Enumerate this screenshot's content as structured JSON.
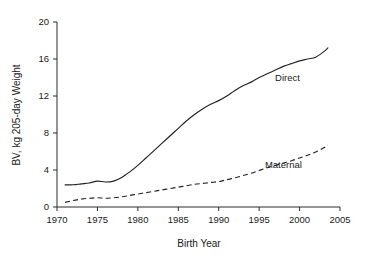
{
  "chart_data": {
    "type": "line",
    "title": "",
    "xlabel": "Birth Year",
    "ylabel": "BV, kg 205-day Weight",
    "xlim": [
      1970,
      2005
    ],
    "ylim": [
      0,
      20
    ],
    "grid": false,
    "legend_position": "inline-annotation",
    "xticks": [
      "1970",
      "1975",
      "1980",
      "1985",
      "1990",
      "1995",
      "2000",
      "2005"
    ],
    "xtick_values": [
      1970,
      1975,
      1980,
      1985,
      1990,
      1995,
      2000,
      2005
    ],
    "yticks": [
      "0",
      "4",
      "8",
      "12",
      "16",
      "20"
    ],
    "ytick_values": [
      0,
      4,
      8,
      12,
      16,
      20
    ],
    "x": [
      1971,
      1972,
      1973,
      1974,
      1975,
      1976,
      1977,
      1978,
      1979,
      1980,
      1981,
      1982,
      1983,
      1984,
      1985,
      1986,
      1987,
      1988,
      1989,
      1990,
      1991,
      1992,
      1993,
      1994,
      1995,
      1996,
      1997,
      1998,
      1999,
      2000,
      2001,
      2002,
      2003,
      2003.5
    ],
    "series": [
      {
        "name": "Direct",
        "style": "solid",
        "color": "#222222",
        "label_x": 1998.5,
        "label_y": 13.6,
        "values": [
          2.4,
          2.4,
          2.5,
          2.6,
          2.8,
          2.7,
          2.8,
          3.2,
          3.8,
          4.5,
          5.3,
          6.1,
          6.9,
          7.7,
          8.5,
          9.3,
          10.0,
          10.6,
          11.1,
          11.5,
          12.0,
          12.6,
          13.1,
          13.5,
          14.0,
          14.4,
          14.8,
          15.2,
          15.5,
          15.8,
          16.0,
          16.2,
          16.8,
          17.2
        ]
      },
      {
        "name": "Maternal",
        "style": "dashed",
        "color": "#222222",
        "label_x": 1998.0,
        "label_y": 4.2,
        "values": [
          0.5,
          0.7,
          0.85,
          0.95,
          1.0,
          0.95,
          1.0,
          1.1,
          1.25,
          1.4,
          1.55,
          1.7,
          1.85,
          2.0,
          2.15,
          2.3,
          2.45,
          2.55,
          2.65,
          2.75,
          2.95,
          3.15,
          3.4,
          3.65,
          3.95,
          4.25,
          4.5,
          4.75,
          5.0,
          5.3,
          5.6,
          5.95,
          6.4,
          6.7
        ]
      }
    ]
  }
}
